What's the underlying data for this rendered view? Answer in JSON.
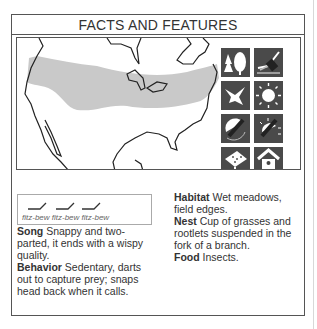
{
  "header": {
    "title": "FACTS AND FEATURES"
  },
  "map": {
    "description": "North America outline with gray breeding range band across northern US and southern Canada",
    "range_color": "#c9c9c9"
  },
  "icons": [
    {
      "name": "forest-habitat-icon",
      "label": "trees"
    },
    {
      "name": "marsh-habitat-icon",
      "label": "wetland"
    },
    {
      "name": "flight-icon",
      "label": "bird in flight"
    },
    {
      "name": "daytime-icon",
      "label": "sun"
    },
    {
      "name": "migration-icon",
      "label": "migration"
    },
    {
      "name": "summer-range-icon",
      "label": "summer"
    },
    {
      "name": "feeder-icon",
      "label": "feeder"
    },
    {
      "name": "birdhouse-icon",
      "label": "birdhouse"
    }
  ],
  "song": {
    "caption": "fitz-bew fitz-bew fitz-bew"
  },
  "facts": {
    "song_label": "Song",
    "song_text": " Snappy and two-parted, it ends with a wispy quality.",
    "behavior_label": "Behavior",
    "behavior_text": " Sedentary, darts out to capture prey; snaps head back when it calls.",
    "habitat_label": "Habitat",
    "habitat_text": " Wet meadows, field edges.",
    "nest_label": "Nest",
    "nest_text": " Cup of grasses and rootlets suspended in the fork of a branch.",
    "food_label": "Food",
    "food_text": " Insects."
  }
}
